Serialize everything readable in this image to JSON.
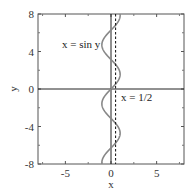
{
  "chart_data": {
    "type": "line",
    "title": "",
    "xlabel": "x",
    "ylabel": "y",
    "xlim": [
      -8,
      8
    ],
    "ylim": [
      -8,
      8
    ],
    "xticks": [
      -5,
      0,
      5
    ],
    "xtick_labels": [
      "-5",
      "0",
      "5"
    ],
    "yticks": [
      -8,
      -4,
      0,
      4,
      8
    ],
    "ytick_labels": [
      "-8",
      "-4",
      "0",
      "4",
      "8"
    ],
    "grid": false,
    "series": [
      {
        "name": "x = sin y",
        "kind": "parametric",
        "equation": "x = sin(y)",
        "y_range": [
          -8,
          8
        ],
        "style": "solid",
        "color": "#888888"
      },
      {
        "name": "x = 1/2",
        "kind": "vertical-line",
        "x": 0.5,
        "style": "dashed",
        "color": "#222222"
      }
    ],
    "axes_lines": [
      {
        "name": "x-axis",
        "y": 0
      },
      {
        "name": "y-axis",
        "x": 0
      }
    ],
    "annotations": [
      {
        "text": "x = sin y",
        "x": -4.5,
        "y": 4.5
      },
      {
        "text": "x = 1/2",
        "x": 0.9,
        "y": -0.8
      }
    ]
  },
  "labels": {
    "xlabel": "x",
    "ylabel": "y",
    "ann_sin": "x = sin y",
    "ann_half": "x = 1/2"
  }
}
